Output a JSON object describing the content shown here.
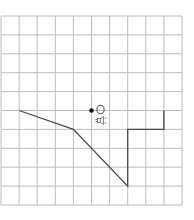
{
  "grid": {
    "columns": 10,
    "rows": 10,
    "origin_px": [
      1,
      16
    ],
    "cell_width_px": 18.1,
    "cell_height_px": 18.9,
    "line_color": "#bdbdbd",
    "background": "#ffffff"
  },
  "path": {
    "color": "#4a4a4a",
    "points_grid": [
      [
        1,
        5
      ],
      [
        4,
        6
      ],
      [
        7,
        9
      ],
      [
        7,
        6
      ],
      [
        9,
        6
      ],
      [
        9,
        5
      ]
    ]
  },
  "marker": {
    "dot_grid": [
      5,
      5
    ],
    "dot_color": "#111111",
    "ellipse_label": "O",
    "icon": "speaker-icon"
  }
}
